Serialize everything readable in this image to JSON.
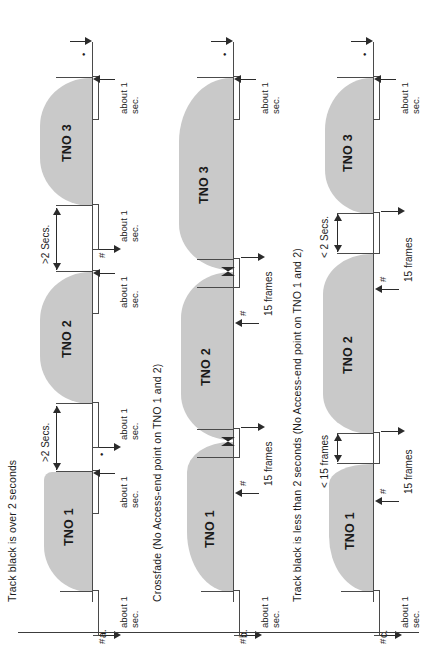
{
  "figure": {
    "orientation": "rotated-90-ccw",
    "page_rule": true,
    "panels": [
      {
        "id": "a",
        "letter": "a.",
        "caption": "Track black is over 2 seconds",
        "tracks": [
          {
            "label": "TNO 1"
          },
          {
            "label": "TNO 2"
          },
          {
            "label": "TNO 3"
          }
        ],
        "gap_labels": [
          ">2 Secs.",
          ">2 Secs."
        ],
        "about_labels": [
          {
            "line1": "about 1",
            "line2": "sec."
          },
          {
            "line1": "about 1",
            "line2": "sec."
          },
          {
            "line1": "about 1",
            "line2": "sec."
          },
          {
            "line1": "about 1",
            "line2": "sec."
          },
          {
            "line1": "about 1",
            "line2": "sec."
          },
          {
            "line1": "about 1",
            "line2": "sec."
          }
        ],
        "marks": [
          "#",
          "•",
          "#",
          "•",
          "#",
          "•"
        ]
      },
      {
        "id": "b",
        "letter": "b.",
        "caption": "Crossfade (No Access-end point on TNO 1 and 2)",
        "tracks": [
          {
            "label": "TNO 1"
          },
          {
            "label": "TNO 2"
          },
          {
            "label": "TNO 3"
          }
        ],
        "frame_labels": [
          "15 frames",
          "15 frames"
        ],
        "about_labels": [
          {
            "line1": "about 1",
            "line2": "sec."
          },
          {
            "line1": "about 1",
            "line2": "sec."
          }
        ],
        "marks": [
          "#",
          "#",
          "#",
          "•"
        ],
        "crossfades": 2
      },
      {
        "id": "c",
        "letter": "c.",
        "caption": "Track black is less than 2 seconds (No Access-end point on TNO 1 and 2)",
        "tracks": [
          {
            "label": "TNO 1"
          },
          {
            "label": "TNO 2"
          },
          {
            "label": "TNO 3"
          }
        ],
        "gap_labels": [
          "< 15 frames",
          "< 2 Secs."
        ],
        "frame_labels": [
          "15 frames",
          "15 frames"
        ],
        "about_labels": [
          {
            "line1": "about 1",
            "line2": "sec."
          },
          {
            "line1": "about 1",
            "line2": "sec."
          }
        ],
        "marks": [
          "#",
          "#",
          "#",
          "•"
        ]
      }
    ]
  },
  "colors": {
    "track_fill": "#c9c9c9",
    "line": "#4a4a4a",
    "arrow": "#2b2b2b",
    "text": "#1c1c1c",
    "page": "#ffffff"
  }
}
